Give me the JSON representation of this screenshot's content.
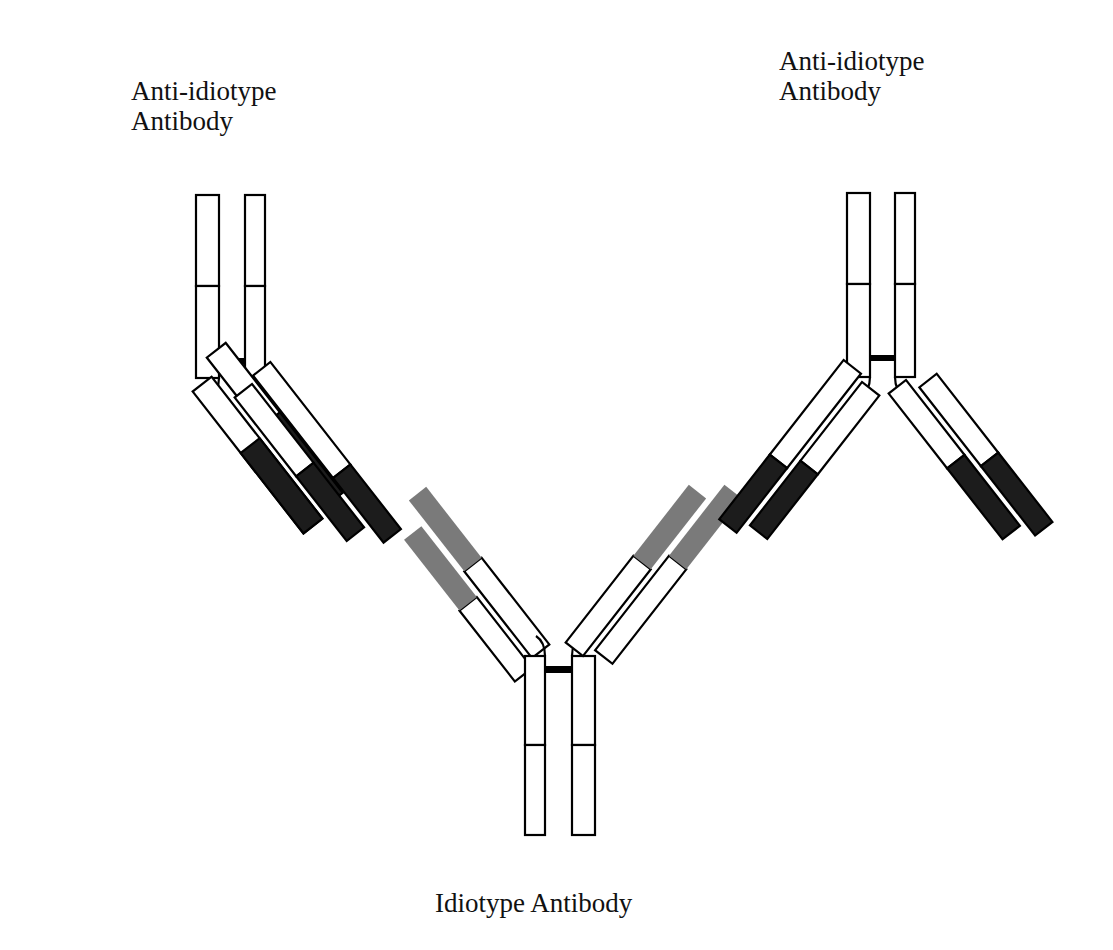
{
  "labels": {
    "left_antibody": [
      "Anti-idiotype",
      "Antibody"
    ],
    "right_antibody": [
      "Anti-idiotype",
      "Antibody"
    ],
    "center_antibody": "Idiotype Antibody"
  },
  "colors": {
    "outline": "#000000",
    "constant_region": "#ffffff",
    "variable_region": "#1c1c1c",
    "idiotope_region": "#7a7a7a",
    "background": "#ffffff"
  },
  "diagram": {
    "antibodies": [
      {
        "name": "anti-idiotype-left",
        "role": "Anti-idiotype Antibody",
        "position": "upper-left"
      },
      {
        "name": "anti-idiotype-right",
        "role": "Anti-idiotype Antibody",
        "position": "upper-right"
      },
      {
        "name": "idiotype-center",
        "role": "Idiotype Antibody",
        "position": "bottom-center"
      }
    ]
  }
}
